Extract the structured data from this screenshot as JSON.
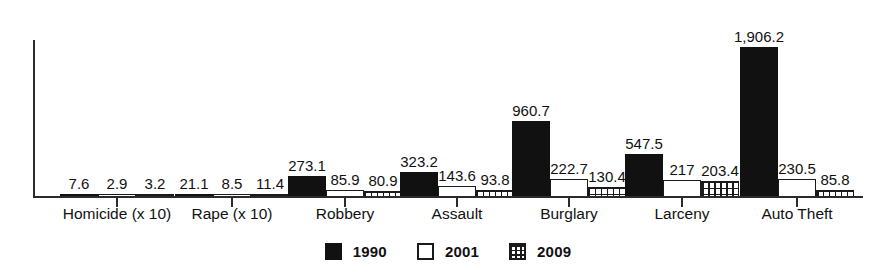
{
  "chart_data": {
    "type": "bar",
    "title": "",
    "subtitle": "",
    "xlabel": "",
    "ylabel": "",
    "grid": false,
    "legend_position": "bottom-center",
    "ylim": [
      0,
      1906.2
    ],
    "axis_ticks_visible": false,
    "categories": [
      "Homicide (x 10)",
      "Rape (x 10)",
      "Robbery",
      "Assault",
      "Burglary",
      "Larceny",
      "Auto Theft"
    ],
    "series": [
      {
        "name": "1990",
        "fill": "solid-black",
        "color": "#111111",
        "values": [
          7.6,
          21.1,
          273.1,
          323.2,
          960.7,
          547.5,
          1906.2
        ],
        "labels": [
          "7.6",
          "21.1",
          "273.1",
          "323.2",
          "960.7",
          "547.5",
          "1,906.2"
        ]
      },
      {
        "name": "2001",
        "fill": "white-outline",
        "color": "#ffffff",
        "values": [
          2.9,
          8.5,
          85.9,
          143.6,
          222.7,
          217.0,
          230.5
        ],
        "labels": [
          "2.9",
          "8.5",
          "85.9",
          "143.6",
          "222.7",
          "217",
          "230.5"
        ]
      },
      {
        "name": "2009",
        "fill": "cross-hatch-grid",
        "color": "#ffffff",
        "values": [
          3.2,
          11.4,
          80.9,
          93.8,
          130.4,
          203.4,
          85.8
        ],
        "labels": [
          "3.2",
          "11.4",
          "80.9",
          "93.8",
          "130.4",
          "203.4",
          "85.8"
        ]
      }
    ]
  },
  "legend": {
    "entries": [
      {
        "label": "1990",
        "swatch": "solid-black-swatch"
      },
      {
        "label": "2001",
        "swatch": "white-outline-swatch"
      },
      {
        "label": "2009",
        "swatch": "cross-hatch-swatch"
      }
    ]
  }
}
